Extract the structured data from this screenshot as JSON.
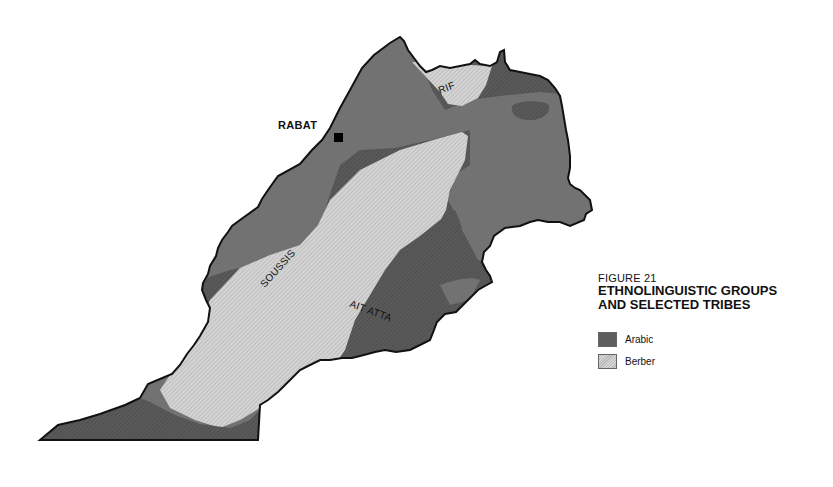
{
  "figure": {
    "number": "FIGURE 21",
    "title_line1": "ETHNOLINGUISTIC GROUPS",
    "title_line2": "AND SELECTED TRIBES"
  },
  "legend": {
    "items": [
      {
        "label": "Arabic",
        "color": "#5e5e5e",
        "pattern": "dark-hatched"
      },
      {
        "label": "Berber",
        "color": "#d0d0d0",
        "pattern": "light-hatched"
      }
    ]
  },
  "map": {
    "cities": [
      {
        "name": "RABAT",
        "marker": "square"
      }
    ],
    "tribe_labels": [
      "RIF",
      "SOUSSIS",
      "AIT ATTA"
    ],
    "colors": {
      "outline": "#111111",
      "arabic_dark": "#555555",
      "arabic_mid": "#707070",
      "berber_light": "#cfcfcf"
    }
  }
}
